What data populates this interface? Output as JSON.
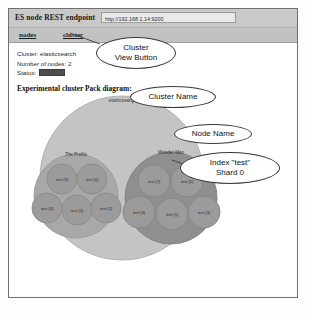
{
  "window": {
    "endpoint_label": "ES node REST endpoint",
    "endpoint_value": "http://192.168.1.14:9200",
    "endpoint_placeholder": "http://host:9200"
  },
  "tabs": [
    {
      "id": "nodes",
      "label": "nodes"
    },
    {
      "id": "cluster",
      "label": "cluster"
    }
  ],
  "summary": {
    "cluster_line": "Cluster: elasticsearch",
    "nodes_line": "Number of nodes: 2",
    "status_label": "Status:",
    "status_color": "#4e4e4e"
  },
  "diagram": {
    "title": "Experimental cluster Pack diagram:",
    "cluster_label": "elasticsearch",
    "cluster_fill": "#c4c4c4",
    "nodes": [
      {
        "name": "The Profile",
        "fill": "#a8a8a8",
        "shards": [
          {
            "label": "test [3]"
          },
          {
            "label": "test [0]"
          },
          {
            "label": "test [4]"
          },
          {
            "label": "test [2]"
          },
          {
            "label": "test [1]"
          }
        ]
      },
      {
        "name": "Wonder Man",
        "fill": "#8f8f8f",
        "shards": [
          {
            "label": "test [2]"
          },
          {
            "label": "test [0]"
          },
          {
            "label": "test [4]"
          },
          {
            "label": "test [1]"
          },
          {
            "label": "test [3]"
          }
        ]
      }
    ],
    "shard_fill": "#9b9b9b"
  },
  "annotations": {
    "cluster_button": {
      "line1": "Cluster",
      "line2": "View Button"
    },
    "cluster_name": {
      "line1": "Cluster Name"
    },
    "node_name": {
      "line1": "Node Name"
    },
    "index_shard": {
      "line1": "Index \"test\"",
      "line2": "Shard 0"
    }
  }
}
